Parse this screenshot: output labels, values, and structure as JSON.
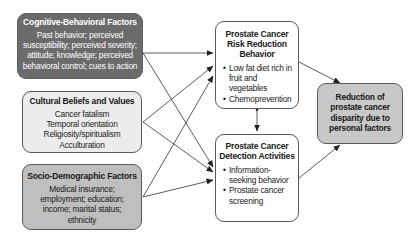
{
  "diagram": {
    "left_boxes": [
      {
        "title": "Cognitive-Behavioral Factors",
        "lines": [
          "Past behavior; perceived",
          "susceptibility; perceived severity;",
          "attitude; knowledge; perceived",
          "behavioral control; cues to action"
        ],
        "fill": "#6b6b6b"
      },
      {
        "title": "Cultural Beliefs and Values",
        "lines": [
          "Cancer fatalism",
          "Temporal orientation",
          "Religiosity/spiritualism",
          "Acculturation"
        ],
        "fill": "#ececec"
      },
      {
        "title": "Socio-Demographic Factors",
        "lines": [
          "Medical insurance;",
          "employment; education;",
          "income; marital status;",
          "ethnicity"
        ],
        "fill": "#bfbfbf"
      }
    ],
    "center_boxes": [
      {
        "title_lines": [
          "Prostate Cancer",
          "Risk Reduction",
          "Behavior"
        ],
        "bullets": [
          "Low fat diet rich in fruit and vegetables",
          "Chemoprevention"
        ]
      },
      {
        "title_lines": [
          "Prostate Cancer",
          "Detection Activities"
        ],
        "bullets": [
          "Information-seeking behavior",
          "Prostate cancer screening"
        ]
      }
    ],
    "outcome_box": {
      "title_lines": [
        "Reduction of",
        "prostate cancer",
        "disparity due to",
        "personal factors"
      ],
      "fill": "#c8c8c8"
    },
    "edges": [
      {
        "from": "Cognitive-Behavioral Factors",
        "to": "Prostate Cancer Risk Reduction Behavior"
      },
      {
        "from": "Cognitive-Behavioral Factors",
        "to": "Prostate Cancer Detection Activities"
      },
      {
        "from": "Cultural Beliefs and Values",
        "to": "Prostate Cancer Risk Reduction Behavior"
      },
      {
        "from": "Cultural Beliefs and Values",
        "to": "Prostate Cancer Detection Activities"
      },
      {
        "from": "Socio-Demographic Factors",
        "to": "Prostate Cancer Risk Reduction Behavior"
      },
      {
        "from": "Socio-Demographic Factors",
        "to": "Prostate Cancer Detection Activities"
      },
      {
        "from": "Prostate Cancer Risk Reduction Behavior",
        "to": "Prostate Cancer Detection Activities",
        "bidirectional": true
      },
      {
        "from": "Prostate Cancer Risk Reduction Behavior",
        "to": "Reduction of prostate cancer disparity due to personal factors"
      },
      {
        "from": "Prostate Cancer Detection Activities",
        "to": "Reduction of prostate cancer disparity due to personal factors"
      }
    ]
  }
}
